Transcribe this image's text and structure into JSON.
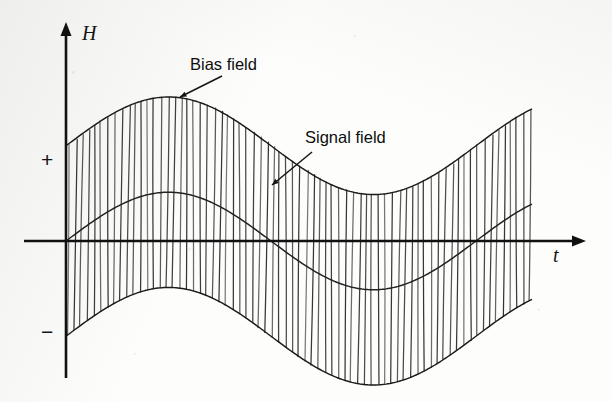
{
  "figure": {
    "background_color": "#fdfdfc",
    "ink_color": "#141414"
  },
  "axes": {
    "vertical": {
      "name": "H",
      "label": "H",
      "origin_x": 66,
      "top_y": 22,
      "bottom_y": 378
    },
    "horizontal": {
      "name": "t",
      "label": "t",
      "axis_y": 241,
      "left_x": 24,
      "right_x": 586,
      "label_x": 553,
      "label_y": 262
    },
    "tick_labels": [
      {
        "text": "+",
        "x": 41,
        "y": 167
      },
      {
        "text": "−",
        "x": 41,
        "y": 339
      }
    ]
  },
  "annotations": [
    {
      "id": "bias-field",
      "text": "Bias field",
      "text_x": 190,
      "text_y": 70,
      "leader": {
        "x1": 222,
        "y1": 76,
        "x2": 180,
        "y2": 97
      }
    },
    {
      "id": "signal-field",
      "text": "Signal field",
      "text_x": 305,
      "text_y": 143,
      "leader": {
        "x1": 312,
        "y1": 152,
        "x2": 272,
        "y2": 185
      }
    }
  ],
  "chart_data": {
    "type": "line",
    "xlabel": "t",
    "ylabel": "H",
    "grid": false,
    "legend": "none",
    "xlim": [
      66,
      533
    ],
    "ylim": [
      -1.45,
      1.45
    ],
    "zero_line_y": 241,
    "series": [
      {
        "name": "Signal field",
        "kind": "sine",
        "amplitude": 0.42,
        "period_px": 410,
        "phase_deg": 0,
        "offset": 0,
        "samples_x": [
          66,
          101,
          136,
          170,
          204,
          239,
          273,
          308,
          342,
          377,
          411,
          446,
          480,
          515,
          533
        ],
        "samples_y": [
          0.0,
          0.22,
          0.37,
          0.42,
          0.37,
          0.22,
          0.0,
          -0.22,
          -0.37,
          -0.42,
          -0.37,
          -0.22,
          0.0,
          0.22,
          0.3
        ]
      },
      {
        "name": "Bias field envelope (upper)",
        "kind": "sine",
        "amplitude": 0.42,
        "period_px": 410,
        "phase_deg": 0,
        "offset": 0.82,
        "samples_x": [
          66,
          101,
          136,
          170,
          204,
          239,
          273,
          308,
          342,
          377,
          411,
          446,
          480,
          515,
          533
        ],
        "samples_y": [
          0.82,
          1.04,
          1.19,
          1.24,
          1.19,
          1.04,
          0.82,
          0.6,
          0.45,
          0.4,
          0.45,
          0.6,
          0.82,
          1.04,
          1.12
        ]
      },
      {
        "name": "Bias field envelope (lower)",
        "kind": "sine",
        "amplitude": 0.42,
        "period_px": 410,
        "phase_deg": 0,
        "offset": -0.82,
        "samples_x": [
          66,
          101,
          136,
          170,
          204,
          239,
          273,
          308,
          342,
          377,
          411,
          446,
          480,
          515,
          533
        ],
        "samples_y": [
          -0.82,
          -0.6,
          -0.45,
          -0.4,
          -0.45,
          -0.6,
          -0.82,
          -1.04,
          -1.19,
          -1.24,
          -1.19,
          -1.04,
          -0.82,
          -0.6,
          -0.52
        ]
      }
    ],
    "carrier": {
      "name": "AC bias carrier",
      "stripe_spacing_px": 6.6,
      "start_x": 68,
      "end_x": 533,
      "stripe_count": 71
    }
  }
}
